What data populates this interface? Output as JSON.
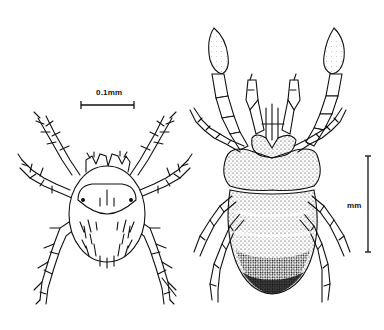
{
  "figure": {
    "left_specimen": {
      "name": "small-mite",
      "scale_label": "0.1mm"
    },
    "right_specimen": {
      "name": "large-mite",
      "scale_label": "mm"
    },
    "colors": {
      "ink": "#111111",
      "background": "#ffffff"
    }
  }
}
